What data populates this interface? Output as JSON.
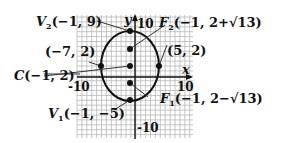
{
  "diagram": {
    "type": "ellipse-graph",
    "colors": {
      "ink": "#111111",
      "grid": "#b8b8b8",
      "background": "#ffffff"
    },
    "axes": {
      "x_label": "x",
      "y_label": "y",
      "x_ticks": [
        "-10",
        "10"
      ],
      "y_ticks": [
        "10",
        "-10"
      ]
    },
    "ellipse": {
      "center": [
        -1,
        2
      ],
      "semi_major_vertical": 7,
      "semi_minor_horizontal": 6
    },
    "points": [
      {
        "id": "V2",
        "name": "V",
        "sub": "2",
        "coords": "(−1, 9)",
        "x": -1,
        "y": 9
      },
      {
        "id": "F2",
        "name": "F",
        "sub": "2",
        "coords": "(−1, 2+√13)",
        "x": -1,
        "y": 5.606
      },
      {
        "id": "left",
        "name": "",
        "sub": "",
        "coords": "(−7, 2)",
        "x": -7,
        "y": 2
      },
      {
        "id": "right",
        "name": "",
        "sub": "",
        "coords": "(5, 2)",
        "x": 5,
        "y": 2
      },
      {
        "id": "C",
        "name": "C",
        "sub": "",
        "coords": "(−1, 2)",
        "x": -1,
        "y": 2
      },
      {
        "id": "F1",
        "name": "F",
        "sub": "1",
        "coords": "(−1, 2−√13)",
        "x": -1,
        "y": -1.606
      },
      {
        "id": "V1",
        "name": "V",
        "sub": "1",
        "coords": "(−1, −5)",
        "x": -1,
        "y": -5
      }
    ]
  }
}
